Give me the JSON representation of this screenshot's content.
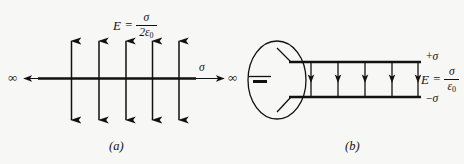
{
  "figure": {
    "background_color": "#f7f7f6",
    "ink_color": "#111111",
    "width": 464,
    "height": 164
  },
  "panel_a": {
    "caption": "(a)",
    "field_equation": {
      "variable": "E",
      "equals": "=",
      "numerator": "σ",
      "denominator_coefficient": "2",
      "denominator_symbol": "ε",
      "denominator_subscript": "0",
      "plain_text": "E = σ / 2ε₀"
    },
    "sheet_label": "σ",
    "infinity_left": "∞",
    "infinity_right": "∞",
    "field_arrow_count": 5,
    "arrow_style": "double-headed-vertical",
    "sheet_description": "infinite charged sheet"
  },
  "panel_b": {
    "caption": "(b)",
    "field_equation": {
      "variable": "E",
      "equals": "=",
      "numerator": "σ",
      "denominator_symbol": "ε",
      "denominator_subscript": "0",
      "plain_text": "E = σ / ε₀"
    },
    "top_plate_label_sign": "+",
    "top_plate_label_symbol": "σ",
    "bottom_plate_label_sign": "−",
    "bottom_plate_label_symbol": "σ",
    "field_arrow_count": 5,
    "arrow_style": "single-headed-down",
    "circuit_element": "battery",
    "loop_shape": "ellipse"
  }
}
